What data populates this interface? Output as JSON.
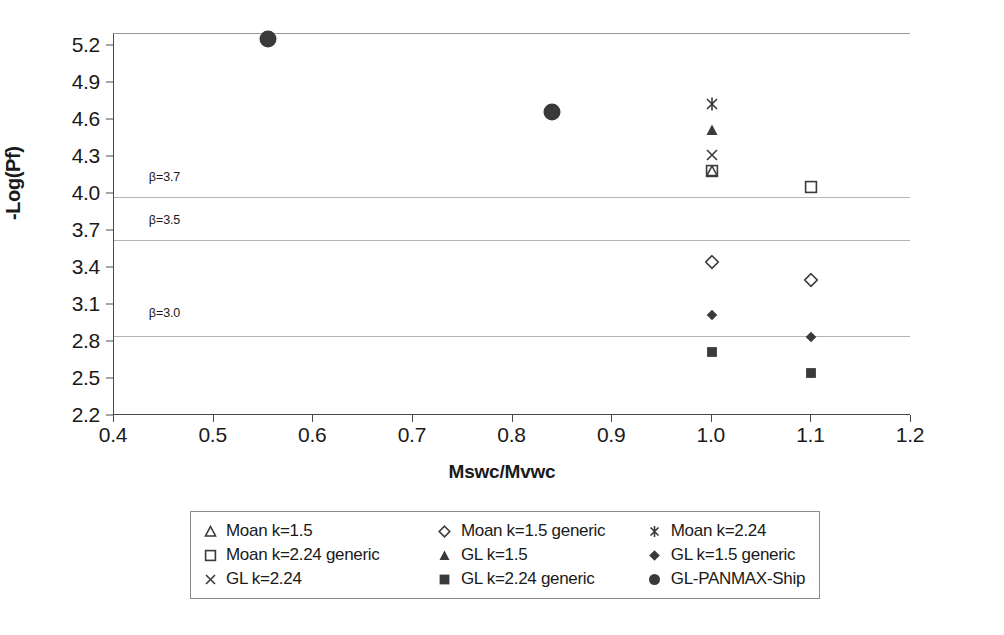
{
  "chart_data": {
    "type": "scatter",
    "title": "",
    "xlabel": "Mswc/Mvwc",
    "ylabel": "-Log(Pf)",
    "xlim": [
      0.4,
      1.2
    ],
    "ylim": [
      2.2,
      5.3
    ],
    "xticks": [
      "0.4",
      "0.5",
      "0.6",
      "0.7",
      "0.8",
      "0.9",
      "1.0",
      "1.1",
      "1.2"
    ],
    "yticks": [
      "2.2",
      "2.5",
      "2.8",
      "3.1",
      "3.4",
      "3.7",
      "4.0",
      "4.3",
      "4.6",
      "4.9",
      "5.2"
    ],
    "grid": "horizontal-annotation-lines-only",
    "legend_position": "bottom",
    "annotations": [
      {
        "text": "β=3.7",
        "x": 0.435,
        "y": 4.13,
        "gridline_y": 3.98
      },
      {
        "text": "β=3.5",
        "x": 0.435,
        "y": 3.78,
        "gridline_y": 3.63
      },
      {
        "text": "β=3.0",
        "x": 0.435,
        "y": 3.03,
        "gridline_y": 2.85
      }
    ],
    "series": [
      {
        "name": "Moan k=1.5",
        "marker": "open-triangle",
        "points": [
          {
            "x": 1.0,
            "y": 4.19
          }
        ]
      },
      {
        "name": "Moan k=1.5 generic",
        "marker": "open-diamond",
        "points": [
          {
            "x": 1.0,
            "y": 3.45
          },
          {
            "x": 1.1,
            "y": 3.3
          }
        ]
      },
      {
        "name": "Moan k=2.24",
        "marker": "asterisk",
        "points": [
          {
            "x": 1.0,
            "y": 4.73
          }
        ]
      },
      {
        "name": "Moan k=2.24 generic",
        "marker": "open-square",
        "points": [
          {
            "x": 1.0,
            "y": 4.19
          },
          {
            "x": 1.1,
            "y": 4.06
          }
        ]
      },
      {
        "name": "GL k=1.5",
        "marker": "filled-triangle",
        "points": [
          {
            "x": 1.0,
            "y": 4.52
          }
        ]
      },
      {
        "name": "GL k=1.5 generic",
        "marker": "filled-diamond",
        "points": [
          {
            "x": 1.0,
            "y": 3.02
          },
          {
            "x": 1.1,
            "y": 2.84
          }
        ]
      },
      {
        "name": "GL k=2.24",
        "marker": "cross-x",
        "points": [
          {
            "x": 1.0,
            "y": 4.32
          }
        ]
      },
      {
        "name": "GL k=2.24 generic",
        "marker": "filled-square",
        "points": [
          {
            "x": 1.0,
            "y": 2.72
          },
          {
            "x": 1.1,
            "y": 2.55
          }
        ]
      },
      {
        "name": "GL-PANMAX-Ship",
        "marker": "filled-circle",
        "points": [
          {
            "x": 0.555,
            "y": 5.26
          },
          {
            "x": 0.84,
            "y": 4.67
          }
        ]
      }
    ]
  },
  "legend": {
    "rows": [
      [
        {
          "marker": "open-triangle",
          "label": "Moan k=1.5"
        },
        {
          "marker": "open-diamond",
          "label": "Moan k=1.5 generic"
        },
        {
          "marker": "asterisk",
          "label": "Moan k=2.24"
        }
      ],
      [
        {
          "marker": "open-square",
          "label": "Moan k=2.24 generic"
        },
        {
          "marker": "filled-triangle",
          "label": "GL k=1.5"
        },
        {
          "marker": "filled-diamond",
          "label": "GL k=1.5 generic"
        }
      ],
      [
        {
          "marker": "cross-x",
          "label": "GL k=2.24"
        },
        {
          "marker": "filled-square",
          "label": "GL k=2.24 generic"
        },
        {
          "marker": "filled-circle",
          "label": "GL-PANMAX-Ship"
        }
      ]
    ]
  },
  "colors": {
    "marker": "#3a3a3a",
    "axis": "#4a4a4a",
    "gridline": "#b4b4b4",
    "text": "#1a1a1a",
    "background": "#ffffff"
  }
}
